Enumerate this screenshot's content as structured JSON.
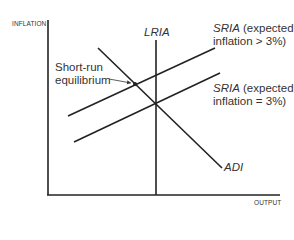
{
  "diagram": {
    "y_axis_label": "INFLATION",
    "x_axis_label": "OUTPUT",
    "curves": {
      "lria": {
        "name": "LRIA"
      },
      "adi": {
        "name": "ADI"
      },
      "sria_high": {
        "name": "SRIA",
        "line1_suffix": " (expected",
        "line2": "inflation > 3%)"
      },
      "sria_base": {
        "name": "SRIA",
        "line1_suffix": " (expected",
        "line2": "inflation = 3%)"
      }
    },
    "annotation": {
      "line1": "Short-run",
      "line2": "equilibrium"
    },
    "colors": {
      "line": "#222222",
      "background": "#ffffff"
    }
  }
}
